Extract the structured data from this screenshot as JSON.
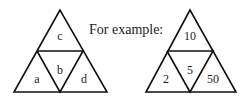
{
  "caption": "For example:",
  "left_triangle": {
    "top": "c",
    "bottom_left": "a",
    "center": "b",
    "bottom_right": "d"
  },
  "right_triangle": {
    "top": "10",
    "bottom_left": "2",
    "center": "5",
    "bottom_right": "50"
  }
}
